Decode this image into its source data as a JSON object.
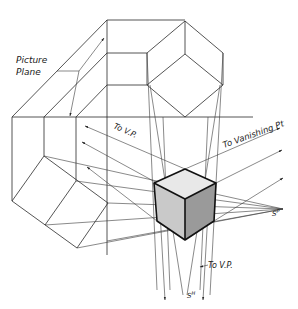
{
  "figure": {
    "type": "technical-drawing",
    "labels": {
      "picture_plane_line1": "Picture",
      "picture_plane_line2": "Plane",
      "to_vp_left": "To V.P.",
      "to_vanishing_pt": "To Vanishing Pt",
      "station_point_plan": "S^P",
      "station_point_elev": "S^H",
      "to_vp_bottom": "To V.P."
    },
    "colors": {
      "line": "#2a2a2a",
      "cube_top_face": "#e8e8e8",
      "cube_left_face": "#c9c9c9",
      "cube_right_face": "#9a9a9a",
      "background": "#ffffff"
    }
  }
}
